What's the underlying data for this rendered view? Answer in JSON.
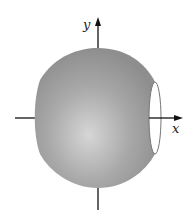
{
  "figure": {
    "axes": {
      "x_label": "x",
      "y_label": "y"
    },
    "colors": {
      "solid_fill": "#9a9a9a",
      "highlight": "#d4d4d4",
      "axis": "#111111",
      "opening_fill": "#ffffff"
    }
  }
}
